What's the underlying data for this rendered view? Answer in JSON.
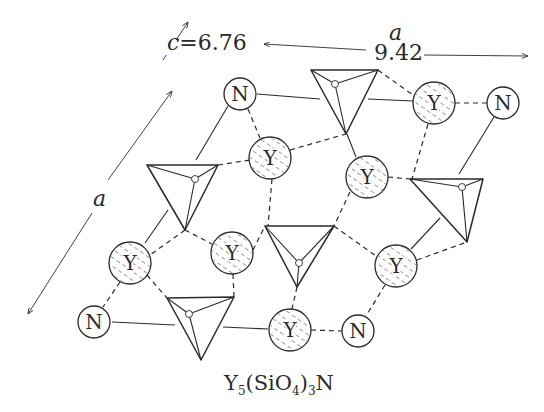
{
  "title": {
    "formula_parts": [
      "Y",
      "5",
      "(SiO",
      "4",
      ")",
      "3",
      "N"
    ],
    "formula_text": "Y5(SiO4)3N"
  },
  "axes": {
    "c": {
      "symbol": "c",
      "equals": "=",
      "value": "6.76"
    },
    "a_horizontal": {
      "symbol": "a",
      "value": "9.42"
    },
    "a_diagonal": {
      "symbol": "a"
    }
  },
  "atoms": [
    {
      "id": "N1",
      "element": "N",
      "hatched": false,
      "x": 240,
      "y": 94,
      "r": 16
    },
    {
      "id": "Y1",
      "element": "Y",
      "hatched": true,
      "x": 270,
      "y": 158,
      "r": 21
    },
    {
      "id": "Y2",
      "element": "Y",
      "hatched": true,
      "x": 434,
      "y": 103,
      "r": 21
    },
    {
      "id": "N2",
      "element": "N",
      "hatched": false,
      "x": 503,
      "y": 103,
      "r": 16
    },
    {
      "id": "Y3",
      "element": "Y",
      "hatched": true,
      "x": 367,
      "y": 177,
      "r": 21
    },
    {
      "id": "Y4",
      "element": "Y",
      "hatched": true,
      "x": 130,
      "y": 263,
      "r": 21
    },
    {
      "id": "Y5",
      "element": "Y",
      "hatched": true,
      "x": 232,
      "y": 253,
      "r": 21
    },
    {
      "id": "Y6",
      "element": "Y",
      "hatched": true,
      "x": 396,
      "y": 266,
      "r": 21
    },
    {
      "id": "N3",
      "element": "N",
      "hatched": false,
      "x": 94,
      "y": 322,
      "r": 16
    },
    {
      "id": "Y7",
      "element": "Y",
      "hatched": true,
      "x": 290,
      "y": 330,
      "r": 21
    },
    {
      "id": "N4",
      "element": "N",
      "hatched": false,
      "x": 358,
      "y": 331,
      "r": 16
    }
  ],
  "tetrahedra": [
    {
      "id": "SiO4-1",
      "b1": [
        311,
        70
      ],
      "b2": [
        378,
        70
      ],
      "apex": [
        346,
        134
      ],
      "top": [
        335,
        84
      ]
    },
    {
      "id": "SiO4-2",
      "b1": [
        147,
        165
      ],
      "b2": [
        218,
        165
      ],
      "apex": [
        185,
        230
      ],
      "top": [
        195,
        179
      ]
    },
    {
      "id": "SiO4-3",
      "b1": [
        410,
        179
      ],
      "b2": [
        483,
        179
      ],
      "apex": [
        467,
        242
      ],
      "top": [
        462,
        187
      ]
    },
    {
      "id": "SiO4-4",
      "b1": [
        265,
        226
      ],
      "b2": [
        334,
        226
      ],
      "apex": [
        297,
        287
      ],
      "top": [
        299,
        263
      ]
    },
    {
      "id": "SiO4-5",
      "b1": [
        167,
        298
      ],
      "b2": [
        234,
        297
      ],
      "apex": [
        201,
        360
      ],
      "top": [
        189,
        314
      ]
    }
  ],
  "colors": {
    "ink": "#2a2a2a",
    "background": "#ffffff"
  }
}
